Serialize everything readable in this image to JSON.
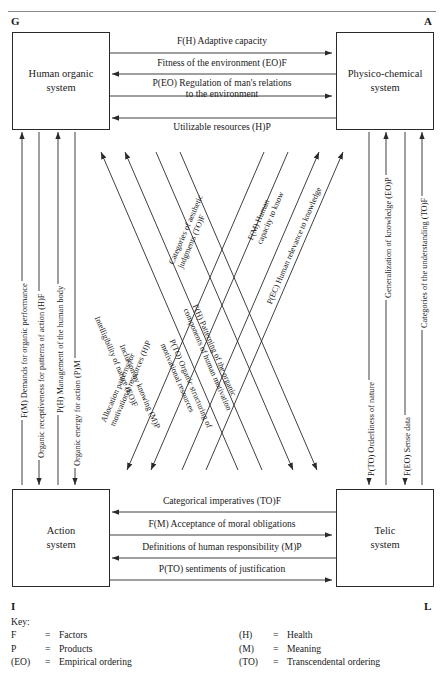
{
  "corners": {
    "g": "G",
    "a": "A",
    "i": "I",
    "l": "L"
  },
  "boxes": {
    "top_left": "Human organic\nsystem",
    "top_left_line1": "Human organic",
    "top_left_line2": "system",
    "top_right_line1": "Physico-chemical",
    "top_right_line2": "system",
    "bottom_left_line1": "Action",
    "bottom_left_line2": "system",
    "bottom_right_line1": "Telic",
    "bottom_right_line2": "system"
  },
  "top_arrows": [
    {
      "label": "F(H) Adaptive capacity",
      "direction": "right"
    },
    {
      "label": "Fitness of the environment (EO)F",
      "direction": "left"
    },
    {
      "label_line1": "P(EO) Regulation of man's relations",
      "label_line2": "to the environment",
      "direction": "right"
    },
    {
      "label": "Utilizable resources (H)P",
      "direction": "left"
    }
  ],
  "bottom_arrows": [
    {
      "label": "Categorical imperatives (TO)F",
      "direction": "left"
    },
    {
      "label": "F(M) Acceptance of moral obligations",
      "direction": "right"
    },
    {
      "label": "Definitions of human responsibility (M)P",
      "direction": "left"
    },
    {
      "label": "P(TO) sentiments of justification",
      "direction": "right"
    }
  ],
  "left_arrows": [
    {
      "label": "F(M) Demands for organic performance",
      "direction": "up"
    },
    {
      "label": "Organic receptiveness for patterns of action (H)F",
      "direction": "down"
    },
    {
      "label": "P(H) Management of the human body",
      "direction": "up"
    },
    {
      "label": "Organic energy for action (P)M",
      "direction": "down"
    }
  ],
  "right_arrows": [
    {
      "label": "P(TO) Orderliness of nature",
      "direction": "down"
    },
    {
      "label": "Generalization of knowledge (EO)P",
      "direction": "up"
    },
    {
      "label": "F(EO) Sense data",
      "direction": "down"
    },
    {
      "label": "Categories of the understanding (TO)F",
      "direction": "up"
    }
  ],
  "diagonal_arrows": [
    {
      "label_line1": "Categories of aesthetic",
      "label_line2": "judgments (TO)F",
      "direction": "up-right"
    },
    {
      "label_line1": "Allocation patterns for",
      "label_line2": "motivational resources (H)P",
      "direction": "up-right"
    },
    {
      "label_line1": "F(M) Human",
      "label_line2": "capacity to know",
      "direction": "up-right"
    },
    {
      "label_line1": "P(EC) Human relevance to knowledge",
      "label_line2": "",
      "direction": "up-right"
    },
    {
      "label_line1": "Intelligibility of nature (EO)F",
      "label_line2": "",
      "direction": "down-left"
    },
    {
      "label_line1": "Inclusion by knowing (M)P",
      "label_line2": "",
      "direction": "down-left"
    },
    {
      "label_line1": "F(H) Patterning of the organic",
      "label_line2": "components of human motivation",
      "direction": "down-right"
    },
    {
      "label_line1": "P(TO) Organic structuring of",
      "label_line2": "motivational resources",
      "direction": "down-right"
    }
  ],
  "key": {
    "title": "Key:",
    "rows": [
      {
        "sym": "F",
        "eq": "=",
        "def": "Factors",
        "sym2": "(H)",
        "eq2": "=",
        "def2": "Health"
      },
      {
        "sym": "P",
        "eq": "=",
        "def": "Products",
        "sym2": "(M)",
        "eq2": "=",
        "def2": "Meaning"
      },
      {
        "sym": "(EO)",
        "eq": "=",
        "def": "Empirical ordering",
        "sym2": "(TO)",
        "eq2": "=",
        "def2": "Transcendental ordering"
      }
    ]
  },
  "colors": {
    "line": "#2a2a2a",
    "rule": "#8a8a8a",
    "text": "#1a1a1a"
  }
}
